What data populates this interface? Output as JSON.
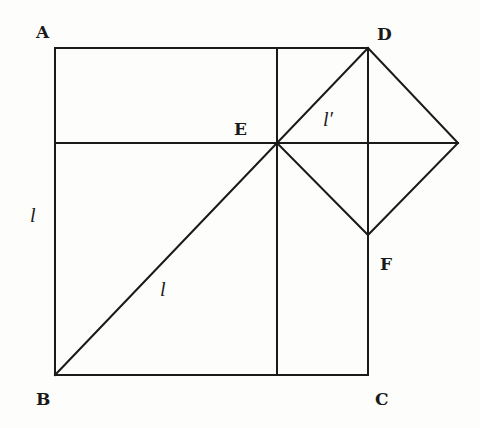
{
  "diagram": {
    "points": {
      "A": {
        "label": "A",
        "x": 55,
        "y": 48,
        "lx": 36,
        "ly": 38
      },
      "D": {
        "label": "D",
        "x": 368,
        "y": 48,
        "lx": 377,
        "ly": 40
      },
      "E": {
        "label": "E",
        "x": 277,
        "y": 143,
        "lx": 234,
        "ly": 135
      },
      "F": {
        "label": "F",
        "x": 368,
        "y": 235,
        "lx": 380,
        "ly": 270
      },
      "B": {
        "label": "B",
        "x": 55,
        "y": 375,
        "lx": 36,
        "ly": 405
      },
      "C": {
        "label": "C",
        "x": 368,
        "y": 375,
        "lx": 375,
        "ly": 405
      }
    },
    "segment_labels": {
      "left_side": {
        "text": "l",
        "x": 30,
        "y": 222
      },
      "diagonal_BE": {
        "text": "l",
        "x": 160,
        "y": 296
      },
      "diagonal_ED": {
        "text": "l′",
        "x": 323,
        "y": 126
      }
    },
    "stroke_color": "#1a1a1a",
    "background": "#fdfdfb"
  }
}
